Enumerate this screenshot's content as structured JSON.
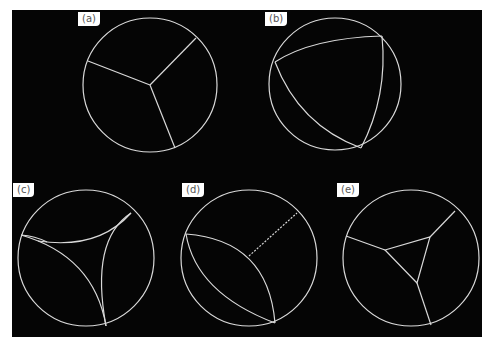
{
  "figure": {
    "background": "#050505",
    "stroke": "#d9d9d9",
    "panels": [
      {
        "id": "a",
        "label": "(a)",
        "description": "circle divided by three straight segments meeting at an interior junction"
      },
      {
        "id": "b",
        "label": "(b)",
        "description": "curved triangle with vertices on the circle"
      },
      {
        "id": "c",
        "label": "(c)",
        "description": "concave curved triangle with cusps on the circle"
      },
      {
        "id": "d",
        "label": "(d)",
        "description": "lens shape between two boundary points with a segment to the circle"
      },
      {
        "id": "e",
        "label": "(e)",
        "description": "central triangle connected to the circle by three segments"
      }
    ]
  }
}
